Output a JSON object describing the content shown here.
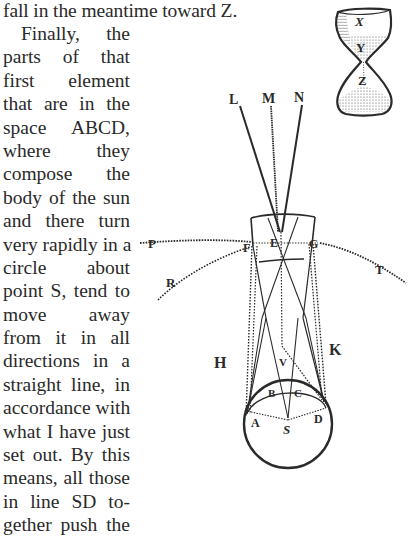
{
  "text": {
    "first_line": "fall in the meantime toward Z.",
    "column_lines": [
      "Finally,  the",
      "parts of that",
      "first element",
      "that are in the",
      "space ABCD,",
      "where  they",
      "compose the",
      "body of the sun",
      "and there turn",
      "very rapidly in a",
      "circle about",
      "point S, tend to",
      "move  away",
      "from it in all",
      "directions in a",
      "straight line, in",
      "accordance with",
      "what I have just",
      "set out. By this",
      "means, all those",
      "in line SD to-",
      "gether push the"
    ]
  },
  "figures": {
    "hourglass": {
      "labels": {
        "x": "X",
        "y": "Y",
        "z": "Z"
      }
    },
    "sun_diagram": {
      "labels": {
        "l": "L",
        "m": "M",
        "n": "N",
        "e": "E",
        "f": "F",
        "g": "G",
        "p": "P",
        "r": "R",
        "t": "T",
        "h": "H",
        "k": "K",
        "v": "V",
        "a": "A",
        "b": "B",
        "c": "C",
        "d": "D",
        "s": "S"
      }
    }
  },
  "colors": {
    "ink": "#2a2a2a",
    "paper": "#ffffff"
  }
}
